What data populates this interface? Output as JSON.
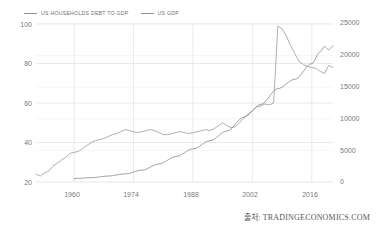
{
  "footer": {
    "source": "출처: TRADINGECONOMICS.COM"
  },
  "legend": {
    "items": [
      {
        "label": "US HOUSEHOLDS DEBT TO GDP",
        "color": "#9a9a9a",
        "axis": "left"
      },
      {
        "label": "US GDP",
        "color": "#8a8a8a",
        "axis": "right"
      }
    ]
  },
  "chart_data": {
    "type": "line",
    "title": "",
    "subtitle": "",
    "xlabel": "",
    "ylabel": "",
    "grid": true,
    "legend_position": "top-left",
    "x_ticks": [
      "1960",
      "1974",
      "1988",
      "2002",
      "2016"
    ],
    "x_tick_values": [
      1960,
      1974,
      1988,
      2002,
      2016
    ],
    "xlim": [
      1951,
      2021
    ],
    "axes": [
      {
        "id": "left",
        "ylabel": "US Households Debt to GDP (percent)",
        "ylim": [
          20,
          100
        ],
        "ticks": [
          20,
          40,
          60,
          80,
          100
        ],
        "tick_labels": [
          "20",
          "40",
          "60",
          "80",
          "100"
        ]
      },
      {
        "id": "right",
        "ylabel": "US GDP (USD Billion)",
        "ylim": [
          0,
          25000
        ],
        "ticks": [
          0,
          5000,
          10000,
          15000,
          20000,
          25000
        ],
        "tick_labels": [
          "0",
          "5000",
          "10000",
          "15000",
          "20000",
          "25000"
        ]
      }
    ],
    "series": [
      {
        "name": "US HOUSEHOLDS DEBT TO GDP",
        "axis": "left",
        "color": "#9a9a9a",
        "unit": "percent",
        "x": [
          1951,
          1952,
          1953,
          1954,
          1955,
          1956,
          1957,
          1958,
          1959,
          1960,
          1961,
          1962,
          1963,
          1964,
          1965,
          1966,
          1967,
          1968,
          1969,
          1970,
          1971,
          1972,
          1973,
          1974,
          1975,
          1976,
          1977,
          1978,
          1979,
          1980,
          1981,
          1982,
          1983,
          1984,
          1985,
          1986,
          1987,
          1988,
          1989,
          1990,
          1991,
          1992,
          1993,
          1994,
          1995,
          1996,
          1997,
          1998,
          1999,
          2000,
          2001,
          2002,
          2003,
          2004,
          2005,
          2006,
          2007,
          2008,
          2009,
          2010,
          2011,
          2012,
          2013,
          2014,
          2015,
          2016,
          2017,
          2018,
          2019,
          2020,
          2021
        ],
        "y": [
          24.0,
          23.0,
          24.5,
          25.5,
          28.0,
          29.5,
          31.0,
          32.5,
          34.5,
          35.0,
          35.5,
          37.0,
          38.5,
          40.0,
          41.0,
          41.5,
          42.0,
          43.0,
          44.0,
          44.5,
          45.5,
          46.5,
          46.0,
          45.5,
          45.0,
          45.5,
          46.0,
          46.5,
          46.0,
          45.0,
          44.0,
          44.0,
          44.5,
          45.0,
          45.5,
          45.0,
          44.5,
          45.0,
          45.5,
          46.0,
          46.5,
          46.0,
          47.0,
          48.5,
          50.0,
          48.5,
          47.5,
          48.0,
          50.0,
          52.5,
          54.5,
          56.0,
          58.0,
          58.5,
          59.5,
          59.0,
          60.0,
          61.0,
          61.5,
          61.0,
          62.0,
          63.5,
          65.0,
          67.0,
          69.5,
          73.0,
          78.0,
          84.0,
          90.0,
          95.0,
          99.0
        ],
        "notes": "Continues: 2008 peak ~99, declining thereafter"
      },
      {
        "name": "US HOUSEHOLDS DEBT TO GDP (recent)",
        "axis": "left",
        "color": "#9a9a9a",
        "unit": "percent",
        "x": [
          2008,
          2009,
          2010,
          2011,
          2012,
          2013,
          2014,
          2015,
          2016,
          2017,
          2018,
          2019,
          2020,
          2021
        ],
        "y": [
          99.0,
          97.5,
          94.0,
          89.0,
          85.0,
          81.0,
          79.5,
          78.5,
          78.0,
          77.5,
          76.0,
          75.0,
          79.0,
          78.0
        ]
      },
      {
        "name": "US GDP",
        "axis": "right",
        "color": "#8a8a8a",
        "unit": "USD Billion",
        "x": [
          1960,
          1964,
          1968,
          1972,
          1976,
          1980,
          1984,
          1988,
          1992,
          1996,
          2000,
          2004,
          2008,
          2012,
          2016,
          2018,
          2019,
          2020,
          2021
        ],
        "y": [
          543,
          686,
          942,
          1280,
          1877,
          2857,
          4038,
          5236,
          6520,
          8073,
          10250,
          12274,
          14770,
          16254,
          18745,
          20612,
          21433,
          20937,
          21500
        ]
      }
    ],
    "annotations": [
      {
        "text": "Series cross near 2016",
        "x": 2016,
        "y": 78
      }
    ]
  }
}
